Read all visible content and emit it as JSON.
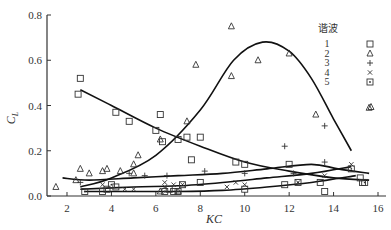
{
  "chart_data": {
    "type": "scatter",
    "title": "",
    "xlabel": "KC",
    "ylabel": "C_L",
    "xlim": [
      1.1,
      16
    ],
    "ylim": [
      0,
      0.8
    ],
    "xticks": [
      2,
      4,
      6,
      8,
      10,
      12,
      14,
      16
    ],
    "yticks": [
      "0.0",
      "0.2",
      "0.4",
      "0.6",
      "0.8"
    ],
    "grid": false,
    "legend_title": "谐波",
    "legend_position": "upper right",
    "series": [
      {
        "name": "1",
        "marker": "square",
        "points": [
          [
            2.6,
            0.52
          ],
          [
            2.5,
            0.45
          ],
          [
            4.2,
            0.37
          ],
          [
            4.8,
            0.33
          ],
          [
            6.2,
            0.36
          ],
          [
            6.0,
            0.29
          ],
          [
            6.3,
            0.24
          ],
          [
            7.0,
            0.25
          ],
          [
            7.4,
            0.26
          ],
          [
            8.0,
            0.26
          ],
          [
            7.6,
            0.16
          ],
          [
            9.6,
            0.15
          ],
          [
            10.0,
            0.14
          ],
          [
            12.0,
            0.14
          ],
          [
            15.6,
            0.7
          ],
          [
            4.2,
            0.04
          ],
          [
            3.8,
            0.03
          ],
          [
            6.6,
            0.03
          ],
          [
            7.2,
            0.05
          ],
          [
            8.0,
            0.06
          ],
          [
            11.8,
            0.05
          ],
          [
            13.4,
            0.06
          ],
          [
            15.2,
            0.08
          ],
          [
            15.3,
            0.06
          ],
          [
            3.6,
            0.02
          ],
          [
            6.8,
            0.02
          ],
          [
            10.0,
            0.03
          ],
          [
            13.6,
            0.02
          ]
        ]
      },
      {
        "name": "2",
        "marker": "triangle",
        "points": [
          [
            1.5,
            0.04
          ],
          [
            2.4,
            0.07
          ],
          [
            2.6,
            0.12
          ],
          [
            3.0,
            0.1
          ],
          [
            3.6,
            0.11
          ],
          [
            3.8,
            0.12
          ],
          [
            4.4,
            0.11
          ],
          [
            5.0,
            0.14
          ],
          [
            5.2,
            0.18
          ],
          [
            5.0,
            0.1
          ],
          [
            6.2,
            0.25
          ],
          [
            7.4,
            0.33
          ],
          [
            7.8,
            0.58
          ],
          [
            9.4,
            0.75
          ],
          [
            9.4,
            0.53
          ],
          [
            10.6,
            0.6
          ],
          [
            12.0,
            0.63
          ],
          [
            13.2,
            0.36
          ],
          [
            15.6,
            0.39
          ],
          [
            15.6,
            0.65
          ],
          [
            7.0,
            0.02
          ],
          [
            6.2,
            0.02
          ]
        ]
      },
      {
        "name": "3",
        "marker": "plus",
        "points": [
          [
            2.6,
            0.06
          ],
          [
            4.8,
            0.1
          ],
          [
            5.5,
            0.09
          ],
          [
            6.5,
            0.09
          ],
          [
            8.2,
            0.11
          ],
          [
            10.0,
            0.1
          ],
          [
            11.8,
            0.22
          ],
          [
            12.2,
            0.1
          ],
          [
            13.6,
            0.31
          ],
          [
            13.6,
            0.15
          ],
          [
            15.6,
            0.63
          ]
        ]
      },
      {
        "name": "4",
        "marker": "x",
        "points": [
          [
            3.6,
            0.05
          ],
          [
            4.6,
            0.03
          ],
          [
            5.0,
            0.03
          ],
          [
            6.4,
            0.06
          ],
          [
            6.4,
            0.04
          ],
          [
            6.8,
            0.05
          ],
          [
            7.2,
            0.05
          ],
          [
            9.2,
            0.04
          ],
          [
            9.6,
            0.06
          ],
          [
            10.0,
            0.05
          ],
          [
            12.4,
            0.06
          ],
          [
            13.6,
            0.09
          ],
          [
            14.8,
            0.14
          ],
          [
            15.6,
            0.61
          ]
        ]
      },
      {
        "name": "5",
        "marker": "dotted-square",
        "points": [
          [
            2.8,
            0.02
          ],
          [
            4.0,
            0.05
          ],
          [
            6.4,
            0.02
          ],
          [
            7.0,
            0.02
          ],
          [
            12.4,
            0.06
          ],
          [
            14.8,
            0.12
          ],
          [
            15.4,
            0.06
          ],
          [
            15.8,
            0.6
          ]
        ]
      }
    ],
    "fit_curves": [
      {
        "name": "harmonic-1-fit",
        "points": [
          [
            2.6,
            0.47
          ],
          [
            4,
            0.4
          ],
          [
            6,
            0.3
          ],
          [
            8,
            0.22
          ],
          [
            10,
            0.15
          ],
          [
            12,
            0.11
          ],
          [
            14,
            0.08
          ],
          [
            15.6,
            0.07
          ]
        ]
      },
      {
        "name": "harmonic-2-fit",
        "points": [
          [
            2.6,
            0.04
          ],
          [
            4,
            0.08
          ],
          [
            6,
            0.18
          ],
          [
            8,
            0.38
          ],
          [
            9.5,
            0.6
          ],
          [
            10.8,
            0.68
          ],
          [
            12,
            0.64
          ],
          [
            13,
            0.52
          ],
          [
            14,
            0.34
          ],
          [
            14.8,
            0.2
          ]
        ]
      },
      {
        "name": "harmonic-3-fit",
        "points": [
          [
            1.8,
            0.08
          ],
          [
            3,
            0.07
          ],
          [
            5,
            0.08
          ],
          [
            7,
            0.09
          ],
          [
            9,
            0.1
          ],
          [
            11,
            0.12
          ],
          [
            13,
            0.14
          ],
          [
            14.2,
            0.12
          ],
          [
            15.6,
            0.1
          ]
        ]
      },
      {
        "name": "harmonic-4-fit",
        "points": [
          [
            2.6,
            0.03
          ],
          [
            5,
            0.04
          ],
          [
            7,
            0.045
          ],
          [
            9,
            0.06
          ],
          [
            11,
            0.08
          ],
          [
            13,
            0.1
          ],
          [
            14.8,
            0.13
          ]
        ]
      },
      {
        "name": "harmonic-5-fit",
        "points": [
          [
            2.8,
            0.02
          ],
          [
            5,
            0.02
          ],
          [
            7,
            0.02
          ],
          [
            9,
            0.025
          ],
          [
            11,
            0.04
          ],
          [
            13,
            0.06
          ],
          [
            15,
            0.09
          ]
        ]
      }
    ]
  }
}
